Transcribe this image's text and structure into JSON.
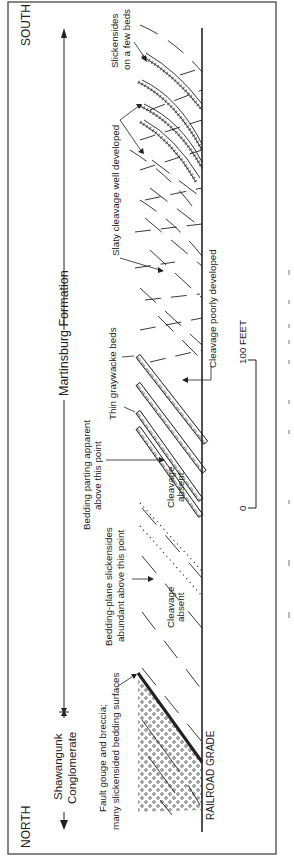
{
  "figure": {
    "orientation": "rotated 90° counter-clockwise (text reads bottom-to-top)",
    "directions": {
      "left": "NORTH",
      "right": "SOUTH"
    },
    "units": {
      "shawangunk_line1": "Shawangunk",
      "shawangunk_line2": "Conglomerate",
      "martinsburg": "Martinsburg Formation"
    },
    "annotations": {
      "fault_line1": "Fault gouge and breccia;",
      "fault_line2": "many slickensided bedding surfaces",
      "bp_slick_line1": "Bedding-plane slickensides",
      "bp_slick_line2": "abundant above this point",
      "bedding_parting_line1": "Bedding parting apparent",
      "bedding_parting_line2": "above this point",
      "cleavage_absent_1_line1": "Cleavage",
      "cleavage_absent_1_line2": "absent",
      "cleavage_absent_2_line1": "Cleavage",
      "cleavage_absent_2_line2": "absent",
      "thin_graywacke": "Thin graywacke beds",
      "cleavage_poorly": "Cleavage poorly developed",
      "slaty_cleavage": "Slaty cleavage well developed",
      "slickensides_few_line1": "Slickensides",
      "slickensides_few_line2": "on a few beds",
      "railroad_grade": "RAILROAD GRADE"
    },
    "scale": {
      "zero": "0",
      "max": "100 FEET"
    },
    "colors": {
      "ink": "#222222",
      "frame": "#555555",
      "background": "#ffffff"
    }
  }
}
